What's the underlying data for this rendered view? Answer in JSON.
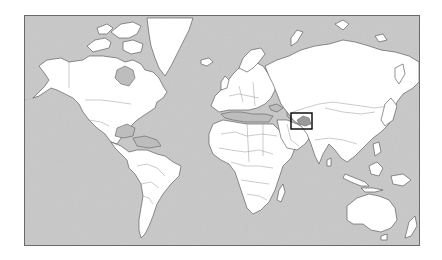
{
  "map": {
    "type": "world-locator-map",
    "projection": "mercator",
    "colors": {
      "ocean": "#c8c8c8",
      "land": "#ffffff",
      "coastline": "#4a4a4a",
      "borders": "#8a8a8a",
      "inland_seas": "#bdbdbd",
      "highlight_box": "#000000"
    },
    "highlight": {
      "region": "Central Asia (Tajikistan / Kyrgyzstan area)",
      "box_px": {
        "x": 290,
        "y": 112,
        "width": 21,
        "height": 16
      }
    },
    "frame_px": {
      "x": 24,
      "y": 15,
      "width": 396,
      "height": 231
    }
  }
}
